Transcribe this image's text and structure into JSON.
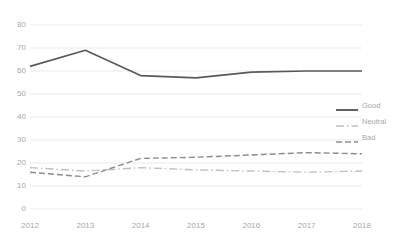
{
  "chart_data": {
    "type": "line",
    "title": "",
    "xlabel": "",
    "ylabel": "",
    "categories": [
      "2012",
      "2013",
      "2014",
      "2015",
      "2016",
      "2017",
      "2018"
    ],
    "x": [
      2012,
      2013,
      2014,
      2015,
      2016,
      2017,
      2018
    ],
    "ylim": [
      0,
      80
    ],
    "yticks": [
      0,
      10,
      20,
      30,
      40,
      50,
      60,
      70,
      80
    ],
    "ytick_labels": [
      "0",
      "10",
      "20",
      "30",
      "40",
      "50",
      "60",
      "70",
      "80"
    ],
    "grid": "horizontal",
    "legend_position": "right",
    "series": [
      {
        "name": "Good",
        "style": "solid",
        "color": "#595959",
        "values": [
          62,
          69,
          58,
          57,
          59.5,
          60,
          60
        ]
      },
      {
        "name": "Neutral",
        "style": "dash-dot",
        "color": "#bfbfbf",
        "values": [
          18,
          16.5,
          18,
          17,
          16.5,
          16,
          16.5
        ]
      },
      {
        "name": "Bad",
        "style": "dashed",
        "color": "#8c8c8c",
        "values": [
          16,
          14,
          22,
          22.5,
          23.5,
          24.5,
          24
        ]
      }
    ]
  },
  "axis": {
    "tick_color": "#a6a6a6",
    "grid_color": "#ebebeb",
    "y_labels": [
      "80",
      "70",
      "60",
      "50",
      "40",
      "30",
      "20",
      "10",
      "0"
    ],
    "x_labels": [
      "2012",
      "2013",
      "2014",
      "2015",
      "2016",
      "2017",
      "2018"
    ]
  },
  "legend": {
    "items": [
      {
        "label": "Good",
        "style": "solid",
        "color": "#595959"
      },
      {
        "label": "Neutral",
        "style": "dash-dot",
        "color": "#bfbfbf"
      },
      {
        "label": "Bad",
        "style": "dashed",
        "color": "#8c8c8c"
      }
    ]
  }
}
